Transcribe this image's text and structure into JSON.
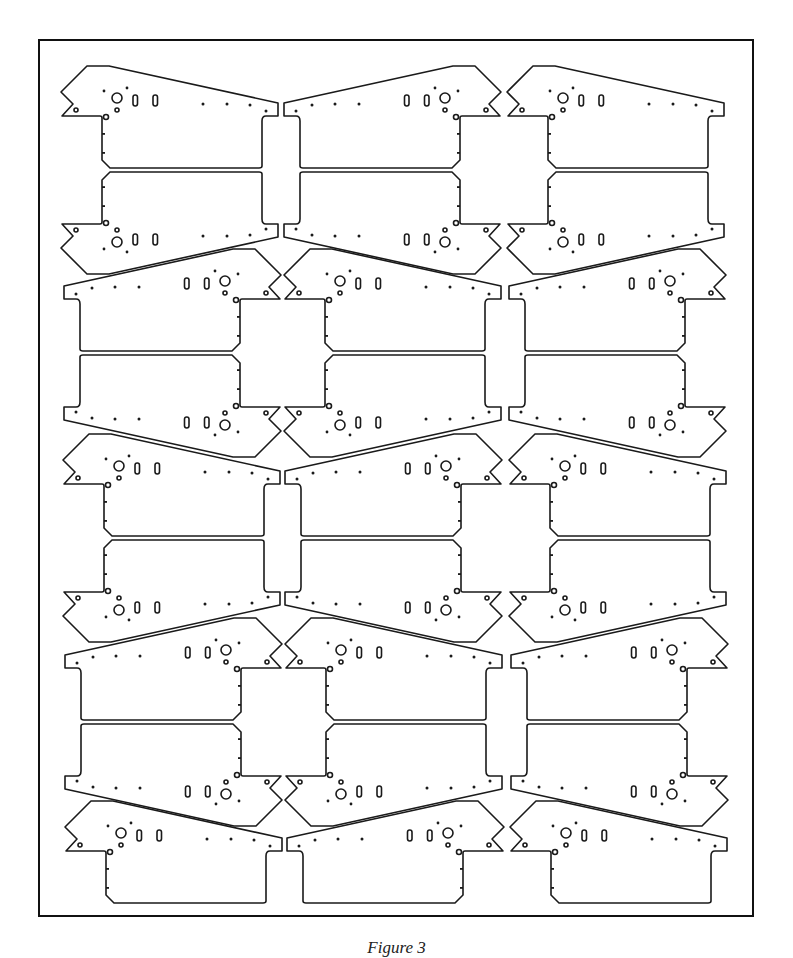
{
  "header": {
    "text": "..."
  },
  "figure": {
    "caption": "Figure 3",
    "frame": {
      "x": 38,
      "y": 39,
      "width": 716,
      "height": 878
    },
    "line_color": "#1a1a1a",
    "plate_count": 27
  },
  "plates": [
    {
      "x": 60,
      "y": 65,
      "flipX": false,
      "flipY": false
    },
    {
      "x": 60,
      "y": 170,
      "flipX": false,
      "flipY": true
    },
    {
      "x": 282,
      "y": 65,
      "flipX": true,
      "flipY": false
    },
    {
      "x": 282,
      "y": 170,
      "flipX": true,
      "flipY": true
    },
    {
      "x": 506,
      "y": 65,
      "flipX": false,
      "flipY": false
    },
    {
      "x": 506,
      "y": 170,
      "flipX": false,
      "flipY": true
    },
    {
      "x": 62,
      "y": 248,
      "flipX": true,
      "flipY": false
    },
    {
      "x": 62,
      "y": 353,
      "flipX": true,
      "flipY": true
    },
    {
      "x": 283,
      "y": 248,
      "flipX": false,
      "flipY": false
    },
    {
      "x": 283,
      "y": 353,
      "flipX": false,
      "flipY": true
    },
    {
      "x": 507,
      "y": 248,
      "flipX": true,
      "flipY": false
    },
    {
      "x": 507,
      "y": 353,
      "flipX": true,
      "flipY": true
    },
    {
      "x": 62,
      "y": 433,
      "flipX": false,
      "flipY": false
    },
    {
      "x": 62,
      "y": 538,
      "flipX": false,
      "flipY": true
    },
    {
      "x": 283,
      "y": 433,
      "flipX": true,
      "flipY": false
    },
    {
      "x": 283,
      "y": 538,
      "flipX": true,
      "flipY": true
    },
    {
      "x": 508,
      "y": 433,
      "flipX": false,
      "flipY": false
    },
    {
      "x": 508,
      "y": 538,
      "flipX": false,
      "flipY": true
    },
    {
      "x": 63,
      "y": 617,
      "flipX": true,
      "flipY": false
    },
    {
      "x": 63,
      "y": 722,
      "flipX": true,
      "flipY": true
    },
    {
      "x": 284,
      "y": 617,
      "flipX": false,
      "flipY": false
    },
    {
      "x": 284,
      "y": 722,
      "flipX": false,
      "flipY": true
    },
    {
      "x": 509,
      "y": 617,
      "flipX": true,
      "flipY": false
    },
    {
      "x": 509,
      "y": 722,
      "flipX": true,
      "flipY": true
    },
    {
      "x": 64,
      "y": 800,
      "flipX": false,
      "flipY": false
    },
    {
      "x": 285,
      "y": 800,
      "flipX": true,
      "flipY": false
    },
    {
      "x": 509,
      "y": 800,
      "flipX": false,
      "flipY": false
    }
  ]
}
